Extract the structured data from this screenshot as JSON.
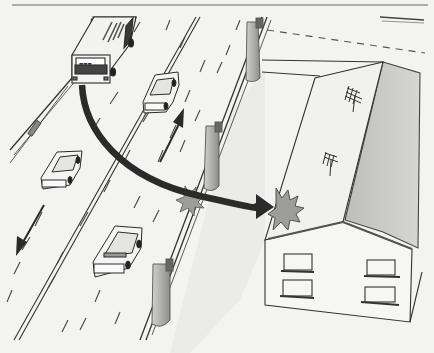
{
  "figure": {
    "colors": {
      "background": "#f3f3f1",
      "ink": "#2a2a2a",
      "arrow": "#2b2b2b",
      "roof_shade": "#c9c9c7",
      "impact_fill": "#9d9d9b",
      "pillar_fill": "#b8b8b6"
    },
    "elements": {
      "bus": "bus",
      "cars": [
        "car-upper-lane",
        "car-left-lane",
        "car-lower-lane"
      ],
      "direction_arrows": [
        "up-right traffic arrow",
        "down-left traffic arrow"
      ],
      "trajectory_arrow": "curved arrow from bus to house roof",
      "impact_marks": [
        "guardrail impact burst",
        "roof impact burst"
      ],
      "house": "two-storey house with gabled roof and two TV antennas",
      "guardrail": "highway median barrier with support pillars"
    }
  }
}
